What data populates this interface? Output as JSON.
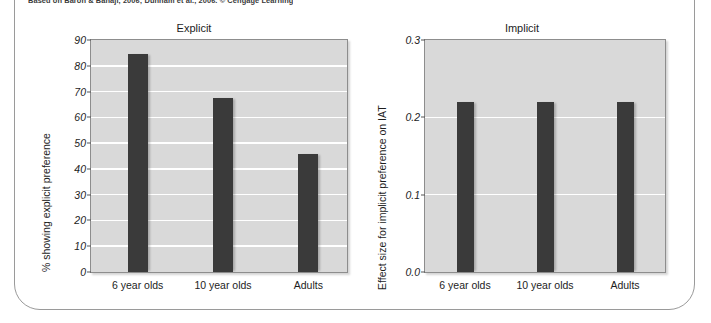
{
  "figure": {
    "source_credit": "Based on Baron & Banaji, 2006; Dunham et al., 2006. © Cengage Learning"
  },
  "chart_data": [
    {
      "type": "bar",
      "title": "Explicit",
      "xlabel": "",
      "ylabel": "% showing explicit preference",
      "categories": [
        "6 year olds",
        "10 year olds",
        "Adults"
      ],
      "values": [
        84.5,
        67.5,
        45.8
      ],
      "ylim": [
        0,
        90
      ],
      "yticks": [
        0,
        10,
        20,
        30,
        40,
        50,
        60,
        70,
        80,
        90
      ],
      "ytick_labels": [
        "0",
        "10",
        "20",
        "30",
        "40",
        "50",
        "60",
        "70",
        "80",
        "90"
      ],
      "grid": true,
      "legend": "none",
      "bar_color": "#3a3a3a",
      "plot_background": "#d9d9d9",
      "gridline_color": "#ffffff"
    },
    {
      "type": "bar",
      "title": "Implicit",
      "xlabel": "",
      "ylabel": "Effect size for implicit preference on IAT",
      "categories": [
        "6 year olds",
        "10 year olds",
        "Adults"
      ],
      "values": [
        0.22,
        0.22,
        0.22
      ],
      "ylim": [
        0.0,
        0.3
      ],
      "yticks": [
        0.0,
        0.1,
        0.2,
        0.3
      ],
      "ytick_labels": [
        "0.0",
        "0.1",
        "0.2",
        "0.3"
      ],
      "grid": true,
      "legend": "none",
      "bar_color": "#3a3a3a",
      "plot_background": "#d9d9d9",
      "gridline_color": "#ffffff"
    }
  ]
}
